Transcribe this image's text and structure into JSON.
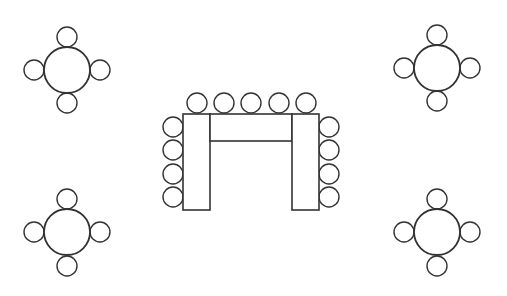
{
  "diagram": {
    "title": "Seating arrangement: U-shape table with four round tables",
    "colors": {
      "background": "#ffffff",
      "stroke": "#333333",
      "fill": "#ffffff"
    },
    "round_tables": [
      {
        "id": "top-left",
        "center": [
          67,
          70
        ],
        "radius": 23,
        "chairs": [
          {
            "position": "top",
            "center": [
              67,
              37
            ],
            "radius": 10
          },
          {
            "position": "bottom",
            "center": [
              67,
              103
            ],
            "radius": 10
          },
          {
            "position": "left",
            "center": [
              34,
              70
            ],
            "radius": 10
          },
          {
            "position": "right",
            "center": [
              100,
              70
            ],
            "radius": 10
          }
        ]
      },
      {
        "id": "top-right",
        "center": [
          437,
          68
        ],
        "radius": 23,
        "chairs": [
          {
            "position": "top",
            "center": [
              437,
              35
            ],
            "radius": 10
          },
          {
            "position": "bottom",
            "center": [
              437,
              101
            ],
            "radius": 10
          },
          {
            "position": "left",
            "center": [
              404,
              68
            ],
            "radius": 10
          },
          {
            "position": "right",
            "center": [
              470,
              68
            ],
            "radius": 10
          }
        ]
      },
      {
        "id": "bottom-left",
        "center": [
          67,
          232
        ],
        "radius": 23,
        "chairs": [
          {
            "position": "top",
            "center": [
              67,
              199
            ],
            "radius": 10
          },
          {
            "position": "bottom",
            "center": [
              67,
              266
            ],
            "radius": 10
          },
          {
            "position": "left",
            "center": [
              34,
              232
            ],
            "radius": 10
          },
          {
            "position": "right",
            "center": [
              100,
              232
            ],
            "radius": 10
          }
        ]
      },
      {
        "id": "bottom-right",
        "center": [
          437,
          232
        ],
        "radius": 23,
        "chairs": [
          {
            "position": "top",
            "center": [
              437,
              199
            ],
            "radius": 10
          },
          {
            "position": "bottom",
            "center": [
              437,
              266
            ],
            "radius": 10
          },
          {
            "position": "left",
            "center": [
              404,
              232
            ],
            "radius": 10
          },
          {
            "position": "right",
            "center": [
              470,
              232
            ],
            "radius": 10
          }
        ]
      }
    ],
    "u_table": {
      "segments": [
        {
          "id": "left-leg",
          "x": 183,
          "y": 114,
          "width": 27,
          "height": 96
        },
        {
          "id": "top-bar",
          "x": 210,
          "y": 114,
          "width": 82,
          "height": 27
        },
        {
          "id": "right-leg",
          "x": 292,
          "y": 114,
          "width": 27,
          "height": 96
        }
      ],
      "chairs": {
        "top": [
          [
            197,
            103
          ],
          [
            224,
            103
          ],
          [
            251,
            103
          ],
          [
            279,
            103
          ],
          [
            306,
            103
          ]
        ],
        "left": [
          [
            173,
            127
          ],
          [
            173,
            150
          ],
          [
            173,
            174
          ],
          [
            173,
            197
          ]
        ],
        "right": [
          [
            329,
            127
          ],
          [
            329,
            150
          ],
          [
            329,
            174
          ],
          [
            329,
            197
          ]
        ],
        "radius": 10
      }
    },
    "counts": {
      "round_tables": 4,
      "chairs_per_round_table": 4,
      "u_table_chairs": 13,
      "total_chairs": 29
    }
  }
}
